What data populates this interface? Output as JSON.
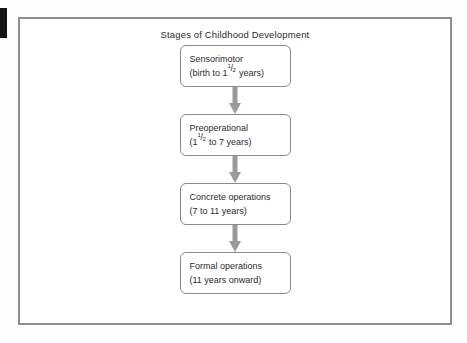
{
  "figure": {
    "title": "Stages of Childhood Development",
    "frame_color": "#8e8e8e",
    "box_border_color": "#8a8a8a",
    "arrow_color": "#9a9a9a",
    "text_color": "#2b2b2b",
    "background": "#ffffff"
  },
  "edge_mark": {
    "name": "page-edge-mark",
    "color": "#151515"
  },
  "stages": [
    {
      "name": "sensorimotor",
      "title": "Sensorimotor",
      "range_prefix": "(birth to 1",
      "frac_numerator": "1",
      "frac_solidus": "/",
      "frac_denominator": "2",
      "range_suffix": " years)",
      "range_plain": "(birth to 1 1/2 years)"
    },
    {
      "name": "preoperational",
      "title": "Preoperational",
      "range_prefix": "(1",
      "frac_numerator": "1",
      "frac_solidus": "/",
      "frac_denominator": "2",
      "range_suffix": " to 7 years)",
      "range_plain": "(1 1/2 to 7 years)"
    },
    {
      "name": "concrete-operations",
      "title": "Concrete operations",
      "range_prefix": "(7 to 11 years)",
      "frac_numerator": "",
      "frac_solidus": "",
      "frac_denominator": "",
      "range_suffix": "",
      "range_plain": "(7 to 11 years)"
    },
    {
      "name": "formal-operations",
      "title": "Formal operations",
      "range_prefix": "(11 years onward)",
      "frac_numerator": "",
      "frac_solidus": "",
      "frac_denominator": "",
      "range_suffix": "",
      "range_plain": "(11 years onward)"
    }
  ],
  "connectors": [
    {
      "name": "arrow-sensorimotor-to-preoperational",
      "direction": "down"
    },
    {
      "name": "arrow-preoperational-to-concrete-operations",
      "direction": "down"
    },
    {
      "name": "arrow-concrete-to-formal-operations",
      "direction": "down"
    }
  ]
}
